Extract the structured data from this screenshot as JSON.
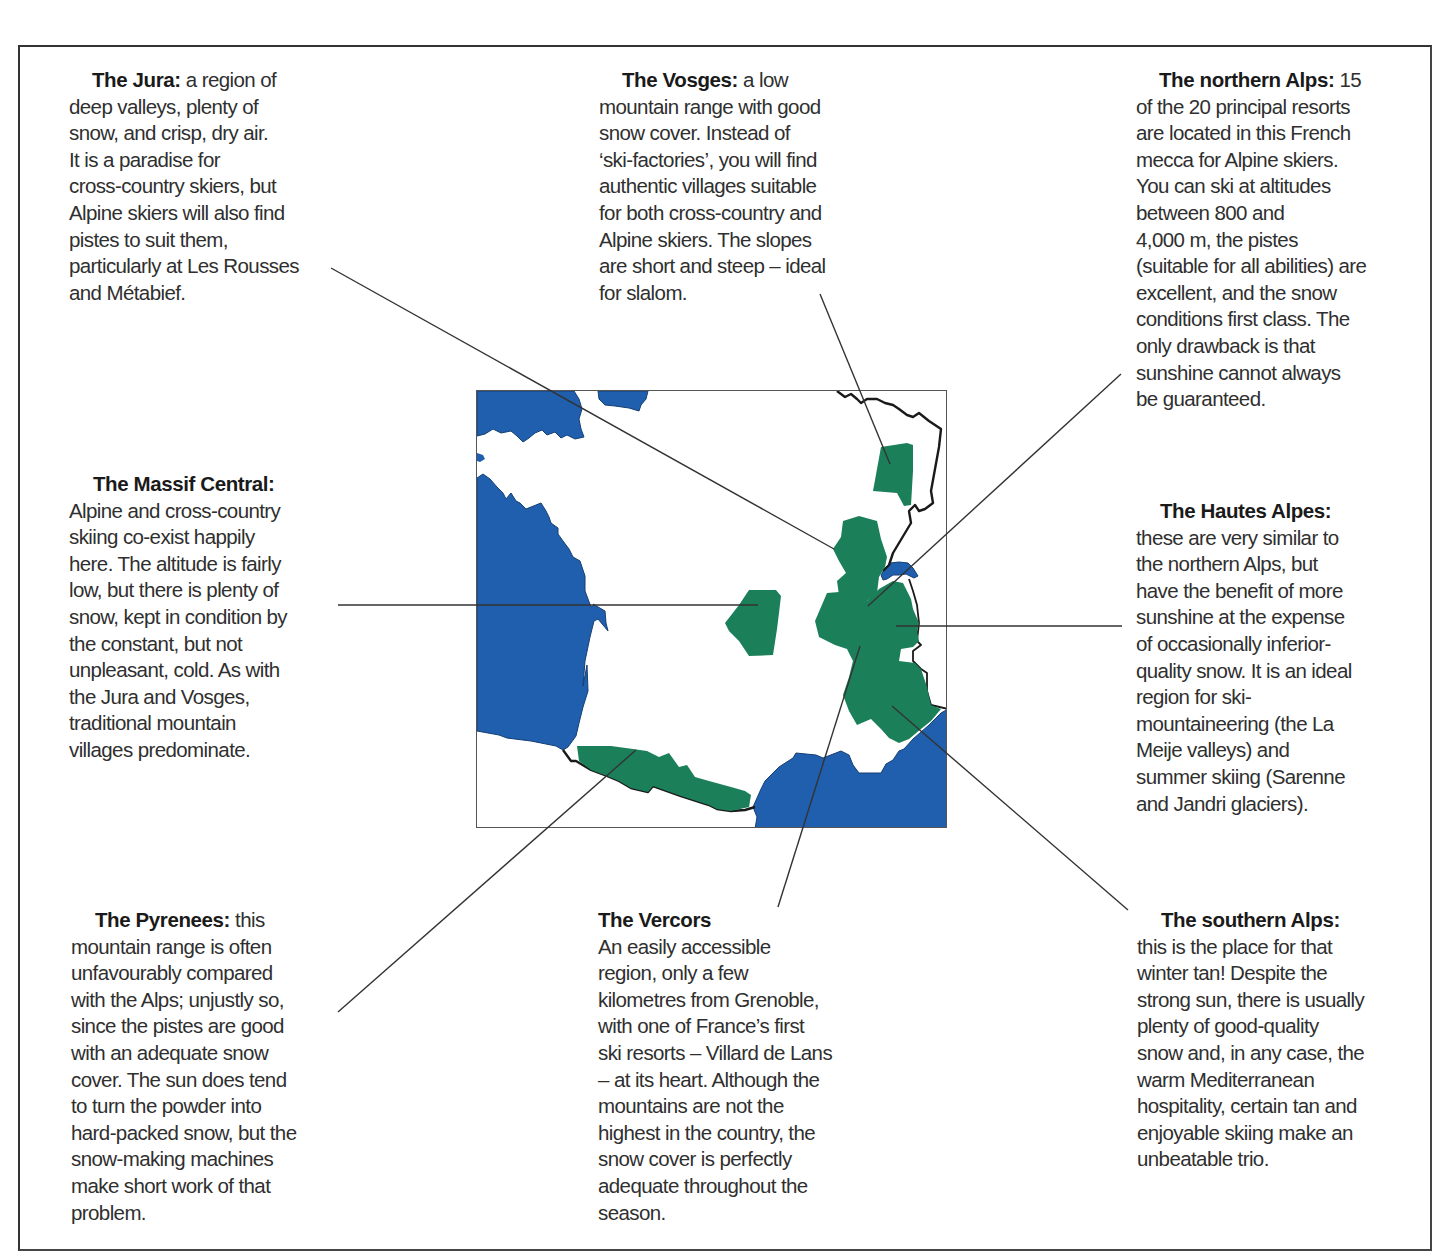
{
  "map": {
    "colors": {
      "sea": "#1f5fad",
      "ski_region": "#1b8059",
      "border": "#1a1a1a",
      "leader_line": "#333333"
    }
  },
  "regions": {
    "jura": {
      "title": "The Jura:",
      "lines": [
        " a region of",
        "deep valleys, plenty of",
        "snow, and crisp, dry air.",
        "It is a paradise for",
        "cross-country skiers, but",
        "Alpine skiers will also find",
        "pistes to suit them,",
        "particularly at Les Rousses",
        "and Métabief."
      ]
    },
    "vosges": {
      "title": "The Vosges:",
      "lines": [
        " a low",
        "mountain range with good",
        "snow cover. Instead of",
        "‘ski-factories’, you will find",
        "authentic villages suitable",
        "for both cross-country and",
        "Alpine skiers. The slopes",
        "are short and steep – ideal",
        "for slalom."
      ]
    },
    "northern_alps": {
      "title": "The northern Alps:",
      "lines": [
        " 15",
        "of the 20 principal resorts",
        "are located in this French",
        "mecca for Alpine skiers.",
        "You can ski at altitudes",
        "between 800 and",
        "4,000 m, the pistes",
        "(suitable for all abilities) are",
        "excellent, and the snow",
        "conditions first class. The",
        "only drawback is that",
        "sunshine cannot always",
        "be guaranteed."
      ]
    },
    "massif_central": {
      "title": "The Massif Central:",
      "lines": [
        "Alpine and cross-country",
        "skiing co-exist happily",
        "here. The altitude is fairly",
        "low, but there is plenty of",
        "snow, kept in condition by",
        "the constant, but not",
        "unpleasant, cold. As with",
        "the Jura and Vosges,",
        "traditional mountain",
        "villages predominate."
      ]
    },
    "hautes_alpes": {
      "title": "The Hautes Alpes:",
      "lines": [
        "these are very similar to",
        "the northern Alps, but",
        "have the benefit of more",
        "sunshine at the expense",
        "of occasionally inferior-",
        "quality snow. It is an ideal",
        "region for ski-",
        "mountaineering (the La",
        "Meije valleys) and",
        "summer skiing (Sarenne",
        "and Jandri glaciers)."
      ]
    },
    "pyrenees": {
      "title": "The Pyrenees:",
      "lines": [
        " this",
        "mountain range is often",
        "unfavourably compared",
        "with the Alps; unjustly so,",
        "since the pistes are good",
        "with an adequate snow",
        "cover. The sun does tend",
        "to turn the powder into",
        "hard-packed snow, but the",
        "snow-making machines",
        "make short work of that",
        "problem."
      ]
    },
    "vercors": {
      "title": "The Vercors",
      "lines": [
        "An easily accessible",
        "region, only a few",
        "kilometres from Grenoble,",
        "with one of France’s first",
        "ski resorts – Villard de Lans",
        "– at its heart. Although the",
        "mountains are not the",
        "highest in the country, the",
        "snow cover is perfectly",
        "adequate throughout the",
        "season."
      ]
    },
    "southern_alps": {
      "title": "The southern Alps:",
      "lines": [
        "this is the place for that",
        "winter tan! Despite the",
        "strong sun, there is usually",
        "plenty of good-quality",
        "snow and, in any case, the",
        "warm Mediterranean",
        "hospitality, certain tan and",
        "enjoyable skiing make an",
        "unbeatable trio."
      ]
    }
  }
}
